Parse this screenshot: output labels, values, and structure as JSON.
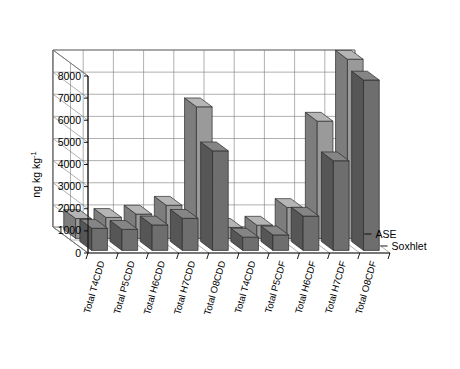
{
  "chart_data": {
    "type": "bar",
    "projection": "3d",
    "title": "",
    "xlabel": "",
    "ylabel": "ng kg",
    "ylabel_sup": "-1",
    "ylim": [
      0,
      8000
    ],
    "ytick_step": 1000,
    "yticks": [
      0,
      1000,
      2000,
      3000,
      4000,
      5000,
      6000,
      7000,
      8000
    ],
    "ytick_labels": [
      "0",
      "1000",
      "2000",
      "3000",
      "4000",
      "5000",
      "6000",
      "7000",
      "8000"
    ],
    "grid": true,
    "legend_position": "right-inside",
    "categories": [
      "Total T4CDD",
      "Total P5CDD",
      "Total H6CDD",
      "Total H7CDD",
      "Total O8CDD",
      "Total T4CDD",
      "Total P5CDF",
      "Total H6CDF",
      "Total H7CDF",
      "Total O8CDF"
    ],
    "series": [
      {
        "name": "ASE",
        "color": "#9a9a9a",
        "top_color": "#b5b5b5",
        "side_color": "#7d7d7d",
        "values": [
          900,
          950,
          1100,
          1500,
          5950,
          500,
          600,
          1400,
          5300,
          8100
        ]
      },
      {
        "name": "Soxhlet",
        "color": "#6e6e6e",
        "top_color": "#858585",
        "side_color": "#565656",
        "values": [
          1000,
          950,
          1150,
          1450,
          4500,
          600,
          700,
          1550,
          4050,
          7700
        ]
      }
    ]
  }
}
